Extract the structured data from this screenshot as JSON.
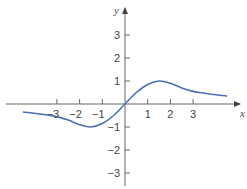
{
  "chart_data": {
    "type": "line",
    "title": "",
    "xlabel": "x",
    "ylabel": "y",
    "xlim": [
      -5.2,
      4.7
    ],
    "ylim": [
      -3.6,
      4.5
    ],
    "grid": false,
    "legend": null,
    "x_ticks": [
      -3,
      -2,
      -1,
      1,
      2,
      3
    ],
    "y_ticks": [
      -3,
      -2,
      -1,
      1,
      2,
      3
    ],
    "x_tick_labels": [
      "−3",
      "−2",
      "−1",
      "1",
      "2",
      "3"
    ],
    "y_tick_labels": [
      "−3",
      "−2",
      "−1",
      "1",
      "2",
      "3"
    ],
    "series": [
      {
        "name": "f(x)",
        "color": "#4a6fb5",
        "x": [
          -4.5,
          -4.0,
          -3.5,
          -3.0,
          -2.5,
          -2.0,
          -1.5,
          -1.0,
          -0.5,
          0,
          0.5,
          1.0,
          1.5,
          2.0,
          2.5,
          3.0,
          3.5,
          4.0,
          4.5
        ],
        "y": [
          -0.35,
          -0.4,
          -0.47,
          -0.55,
          -0.7,
          -0.9,
          -1.0,
          -0.85,
          -0.5,
          0,
          0.5,
          0.85,
          1.0,
          0.9,
          0.7,
          0.55,
          0.47,
          0.4,
          0.35
        ]
      }
    ]
  }
}
